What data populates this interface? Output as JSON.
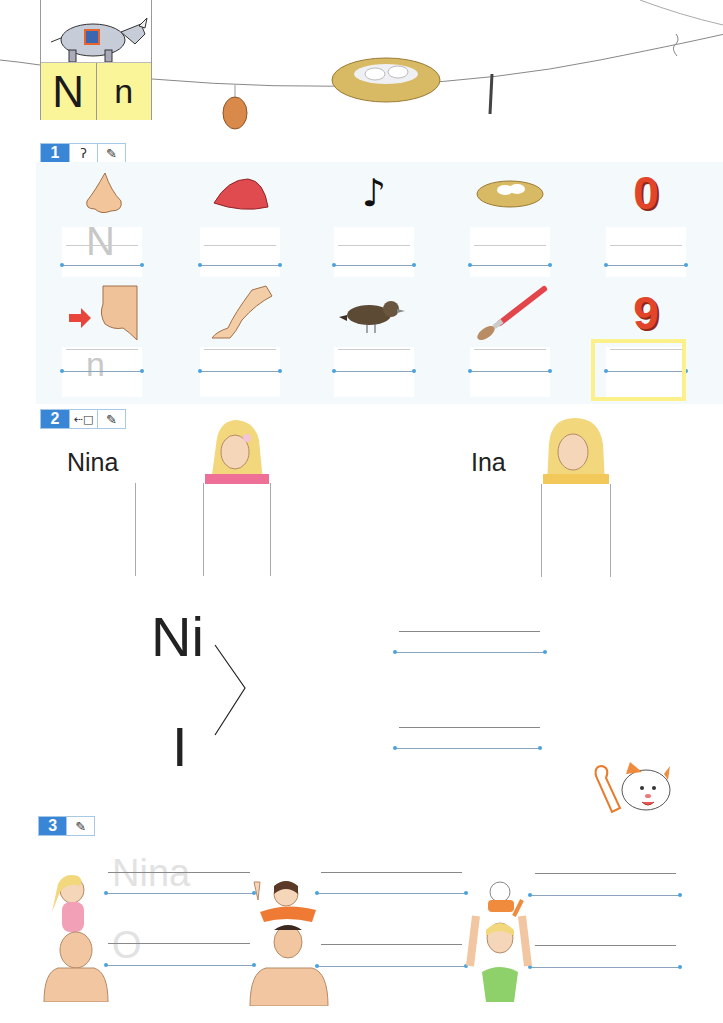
{
  "header": {
    "letter_upper": "N",
    "letter_lower": "n",
    "mascot": "rhino-mascot",
    "clothesline_items": [
      "walnut",
      "nest-with-eggs",
      "needle",
      "knot"
    ]
  },
  "colors": {
    "letter_card_bg": "#fbf59a",
    "section_badge": "#3a86d6",
    "panel_bg": "#f4f9fc",
    "highlight_border": "#fbf089",
    "number_red": "#e2452a",
    "baseline_dot": "#4aa3df"
  },
  "exercise1": {
    "number": "1",
    "icons": [
      "ear-icon",
      "pencil-icon"
    ],
    "row1": [
      {
        "picture": "nose",
        "trace": "N"
      },
      {
        "picture": "red-cap",
        "trace": ""
      },
      {
        "picture": "music-note",
        "trace": ""
      },
      {
        "picture": "nest",
        "trace": ""
      },
      {
        "picture": "zero",
        "number": "0",
        "trace": ""
      }
    ],
    "row2": [
      {
        "picture": "chin-with-arrow",
        "trace": "n"
      },
      {
        "picture": "leg",
        "trace": ""
      },
      {
        "picture": "bird",
        "trace": ""
      },
      {
        "picture": "paintbrush",
        "trace": ""
      },
      {
        "picture": "nine",
        "number": "9",
        "trace": "",
        "highlighted": true
      }
    ]
  },
  "exercise2": {
    "number": "2",
    "icons": [
      "connect-icon",
      "pencil-icon"
    ],
    "names": [
      {
        "label": "Nina",
        "portrait": "nina-girl"
      },
      {
        "label": "Ina",
        "portrait": "ina-girl"
      }
    ],
    "syllables": [
      "Ni",
      "I"
    ]
  },
  "exercise3": {
    "number": "3",
    "icons": [
      "pencil-icon"
    ],
    "trace_words": [
      "Nina",
      "O"
    ],
    "pictures": [
      "girl-on-fathers-shoulders",
      "child-on-mans-shoulders",
      "woman-holding-cat"
    ]
  }
}
